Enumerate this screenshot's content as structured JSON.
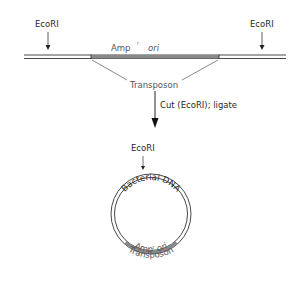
{
  "diagram": {
    "top": {
      "left_site_label": "EcoRI",
      "right_site_label": "EcoRI",
      "amp_label": "Amp",
      "amp_superscript": "r",
      "ori_label": "ori",
      "transposon_label": "Transposon"
    },
    "step": {
      "label": "Cut (EcoRI); ligate"
    },
    "plasmid": {
      "site_label": "EcoRI",
      "bacterial_dna_label": "Bacterial DNA",
      "amp_label": "Amp",
      "amp_superscript": "r",
      "ori_label": "ori",
      "transposon_label": "Transposon"
    },
    "colors": {
      "line": "#333333",
      "transposon": "#8a8a8a"
    }
  }
}
